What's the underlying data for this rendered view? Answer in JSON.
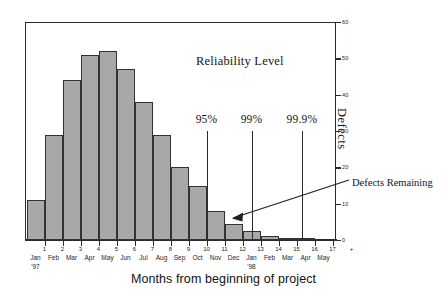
{
  "chart_data": {
    "type": "bar",
    "title": "",
    "xlabel": "Months from beginning of project",
    "ylabel": "Defects",
    "ylim": [
      0,
      60
    ],
    "ytick_values": [
      60,
      50,
      40,
      30,
      20,
      10,
      0
    ],
    "ytick_labels": [
      "60",
      "50",
      "40",
      "30",
      "20",
      "10",
      "0"
    ],
    "y_axis_position": "right",
    "grid": false,
    "legend": "none",
    "categories": [
      "0",
      "1",
      "2",
      "3",
      "4",
      "5",
      "6",
      "7",
      "8",
      "9",
      "10",
      "11",
      "12",
      "13",
      "14",
      "15"
    ],
    "xtick_numbers": [
      "1",
      "2",
      "3",
      "4",
      "5",
      "6",
      "7",
      "8",
      "9",
      "10",
      "11",
      "12",
      "13",
      "14",
      "15",
      "16",
      "17"
    ],
    "month_labels": [
      "Jan",
      "Feb",
      "Mar",
      "Apr",
      "May",
      "Jun",
      "Jul",
      "Aug",
      "Sep",
      "Oct",
      "Nov",
      "Dec",
      "Jan",
      "Feb",
      "Mar",
      "Apr",
      "May"
    ],
    "year_labels": [
      {
        "index": 0,
        "text": "'97"
      },
      {
        "index": 12,
        "text": "'98"
      }
    ],
    "values": [
      11,
      29,
      44,
      51,
      52,
      47,
      38,
      29,
      20,
      15,
      8,
      4.5,
      2.5,
      1,
      0.5,
      0.3
    ],
    "bar_color": "#a8a8a8",
    "bar_edge_color": "#333333",
    "annotations": [
      {
        "name": "reliability-level-heading",
        "text": "Reliability Level"
      },
      {
        "name": "defects-remaining-callout",
        "text": "Defects Remaining"
      }
    ],
    "reference_lines": [
      {
        "label": "95%",
        "month_index": 10,
        "top_value": 30
      },
      {
        "label": "99%",
        "month_index": 12.5,
        "top_value": 30
      },
      {
        "label": "99.9%",
        "month_index": 15.3,
        "top_value": 30
      }
    ]
  }
}
